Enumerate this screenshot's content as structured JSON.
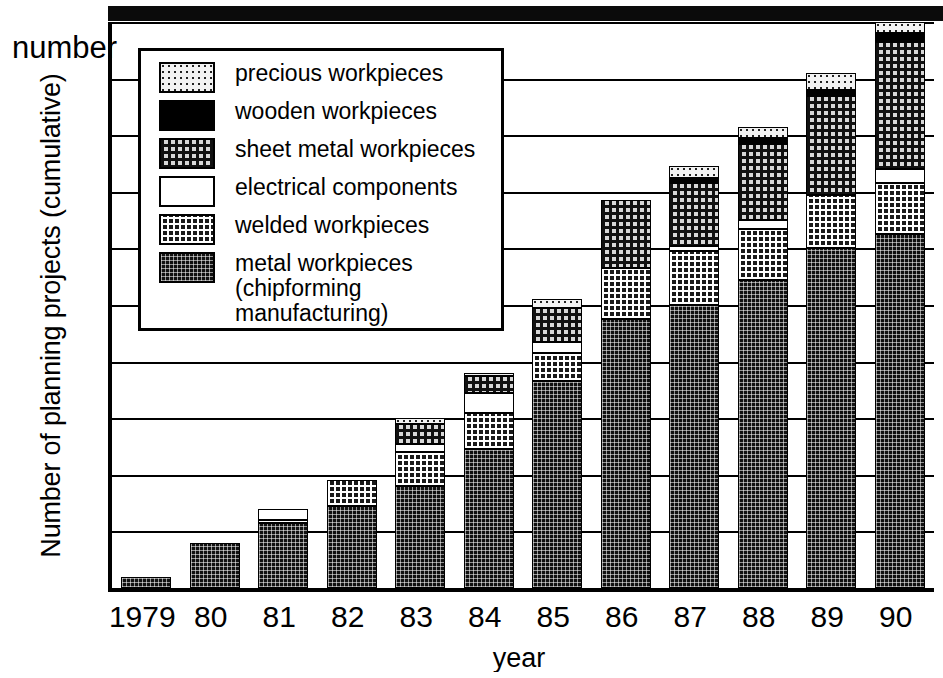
{
  "chart_data": {
    "type": "bar",
    "subtype": "stacked-bar",
    "title": "",
    "xlabel": "year",
    "ylabel": "Number of planning projects (cumulative)",
    "yunit_label": "number",
    "categories": [
      "1979",
      "80",
      "81",
      "82",
      "83",
      "84",
      "85",
      "86",
      "87",
      "88",
      "89",
      "90"
    ],
    "ylim": [
      0,
      100
    ],
    "ytick_labels": [
      "0",
      "10",
      "20",
      "30",
      "40",
      "50",
      "60",
      "70",
      "80",
      "90",
      "100"
    ],
    "ytick_values": [
      0,
      10,
      20,
      30,
      40,
      50,
      60,
      70,
      80,
      90,
      100
    ],
    "grid": true,
    "legend_position": "upper-left-inside",
    "stack_order_bottom_to_top": [
      "metal workpieces (chipforming manufacturing)",
      "welded workpieces",
      "electrical components",
      "sheet metal workpieces",
      "wooden workpieces",
      "precious workpieces"
    ],
    "series": [
      {
        "name": "metal workpieces (chipforming manufacturing)",
        "key": "metal",
        "values": [
          2,
          8,
          11.5,
          14.5,
          18,
          24.5,
          36.5,
          47.5,
          50,
          54.5,
          60,
          62.5
        ]
      },
      {
        "name": "welded workpieces",
        "key": "welded",
        "values": [
          0,
          0,
          0.5,
          4.5,
          6,
          6.5,
          5,
          9,
          9.5,
          9,
          9.5,
          9
        ]
      },
      {
        "name": "electrical components",
        "key": "electrical",
        "values": [
          0,
          0,
          2,
          0,
          1.5,
          3.5,
          2,
          0,
          1,
          1.5,
          0,
          2.5
        ]
      },
      {
        "name": "sheet metal workpieces",
        "key": "sheet",
        "values": [
          0,
          0,
          0,
          0,
          3.5,
          3,
          6,
          12,
          11,
          13.5,
          17.5,
          22.5
        ]
      },
      {
        "name": "wooden workpieces",
        "key": "wooden",
        "values": [
          0,
          0,
          0,
          0,
          0,
          0,
          0,
          0,
          1,
          1,
          1,
          1.5
        ]
      },
      {
        "name": "precious workpieces",
        "key": "precious",
        "values": [
          0,
          0,
          0,
          0,
          1,
          0.5,
          1.5,
          0,
          2,
          2,
          3,
          2
        ]
      }
    ],
    "cumulative_totals": [
      2,
      8,
      14,
      19,
      30,
      38,
      51,
      68.5,
      74.5,
      81.5,
      91,
      100
    ]
  },
  "legend": {
    "items": [
      {
        "label": "precious workpieces",
        "pattern": "precious",
        "swatch_name": "legend-swatch-precious"
      },
      {
        "label": "wooden workpieces",
        "pattern": "wooden",
        "swatch_name": "legend-swatch-wooden"
      },
      {
        "label": "sheet metal workpieces",
        "pattern": "sheet",
        "swatch_name": "legend-swatch-sheet-metal"
      },
      {
        "label": "electrical components",
        "pattern": "electrical",
        "swatch_name": "legend-swatch-electrical"
      },
      {
        "label": "welded workpieces",
        "pattern": "welded",
        "swatch_name": "legend-swatch-welded"
      },
      {
        "label": "metal workpieces\n(chipforming manufacturing)",
        "pattern": "metal",
        "swatch_name": "legend-swatch-metal"
      }
    ]
  },
  "colors": {
    "ink": "#000000",
    "paper": "#ffffff",
    "metal": "#111111",
    "welded": "#1a1a1a",
    "electrical": "#ffffff",
    "sheet": "#d8d8d8",
    "wooden": "#000000",
    "precious": "#f2f2f2"
  }
}
